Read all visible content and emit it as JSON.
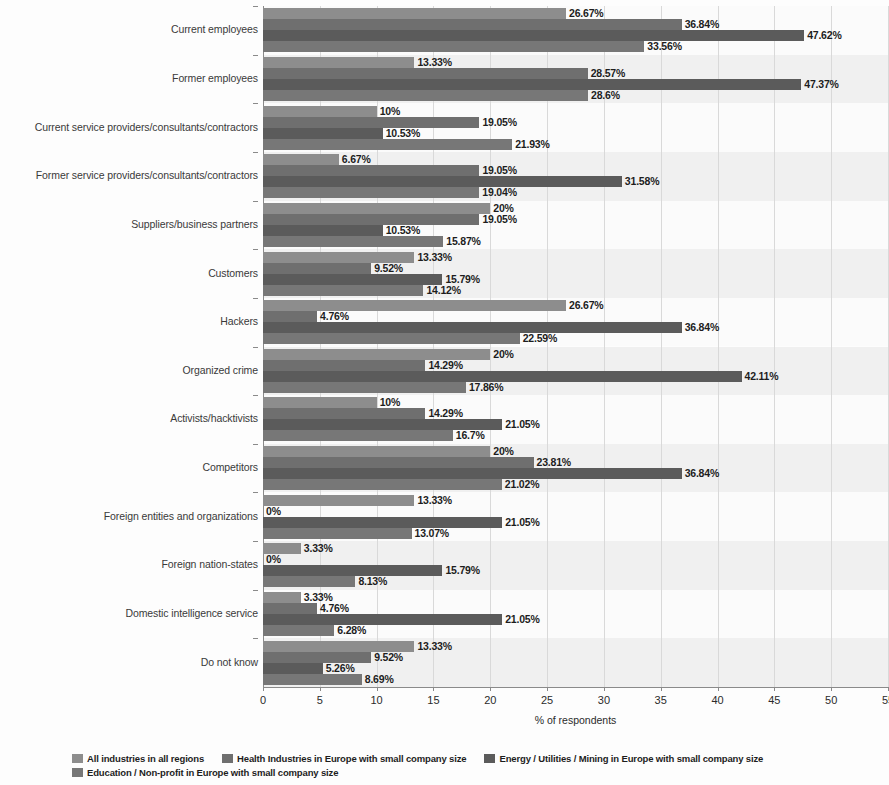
{
  "chart_data": {
    "type": "bar",
    "orientation": "horizontal",
    "title": "",
    "xlabel": "% of respondents",
    "ylabel": "",
    "xlim": [
      0,
      55
    ],
    "xticks": [
      0,
      5,
      10,
      15,
      20,
      25,
      30,
      35,
      40,
      45,
      50,
      55
    ],
    "grid": true,
    "legend_position": "bottom",
    "categories": [
      "Current employees",
      "Former employees",
      "Current service providers/consultants/contractors",
      "Former service providers/consultants/contractors",
      "Suppliers/business partners",
      "Customers",
      "Hackers",
      "Organized crime",
      "Activists/hacktivists",
      "Competitors",
      "Foreign entities and organizations",
      "Foreign nation-states",
      "Domestic intelligence service",
      "Do not know"
    ],
    "series": [
      {
        "name": "All industries in all regions",
        "color": "#8d8d8d",
        "values": [
          26.67,
          13.33,
          10,
          6.67,
          20,
          13.33,
          26.67,
          20,
          10,
          20,
          13.33,
          3.33,
          3.33,
          13.33
        ],
        "labels": [
          "26.67%",
          "13.33%",
          "10%",
          "6.67%",
          "20%",
          "13.33%",
          "26.67%",
          "20%",
          "10%",
          "20%",
          "13.33%",
          "3.33%",
          "3.33%",
          "13.33%"
        ]
      },
      {
        "name": "Health Industries in Europe with small company size",
        "color": "#6f6f6f",
        "values": [
          36.84,
          28.57,
          19.05,
          19.05,
          19.05,
          9.52,
          4.76,
          14.29,
          14.29,
          23.81,
          0,
          0,
          4.76,
          9.52
        ],
        "labels": [
          "36.84%",
          "28.57%",
          "19.05%",
          "19.05%",
          "19.05%",
          "9.52%",
          "4.76%",
          "14.29%",
          "14.29%",
          "23.81%",
          "0%",
          "0%",
          "4.76%",
          "9.52%"
        ]
      },
      {
        "name": "Energy / Utilities / Mining in Europe with small company size",
        "color": "#5b5b5b",
        "values": [
          47.62,
          47.37,
          10.53,
          31.58,
          10.53,
          15.79,
          36.84,
          42.11,
          21.05,
          36.84,
          21.05,
          15.79,
          21.05,
          5.26
        ],
        "labels": [
          "47.62%",
          "47.37%",
          "10.53%",
          "31.58%",
          "10.53%",
          "15.79%",
          "36.84%",
          "42.11%",
          "21.05%",
          "36.84%",
          "21.05%",
          "15.79%",
          "21.05%",
          "5.26%"
        ]
      },
      {
        "name": "Education / Non-profit in Europe with small company size",
        "color": "#777777",
        "values": [
          33.56,
          28.6,
          21.93,
          19.04,
          15.87,
          14.12,
          22.59,
          17.86,
          16.7,
          21.02,
          13.07,
          8.13,
          6.28,
          8.69
        ],
        "labels": [
          "33.56%",
          "28.6%",
          "21.93%",
          "19.04%",
          "15.87%",
          "14.12%",
          "22.59%",
          "17.86%",
          "16.7%",
          "21.02%",
          "13.07%",
          "8.13%",
          "6.28%",
          "8.69%"
        ]
      }
    ]
  },
  "axis": {
    "x_title": "% of respondents"
  }
}
